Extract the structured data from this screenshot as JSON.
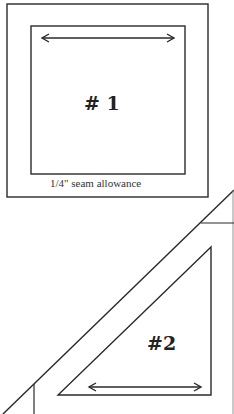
{
  "pattern_pieces": [
    {
      "id": "1",
      "label": "# 1",
      "shape": "square",
      "note": "1/4\" seam allowance",
      "grain_arrow": "horizontal-double"
    },
    {
      "id": "2",
      "label": "#2",
      "shape": "right-triangle",
      "grain_arrow": "horizontal-double"
    }
  ],
  "colors": {
    "line": "#2a2a2a",
    "background": "#ffffff"
  }
}
